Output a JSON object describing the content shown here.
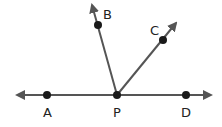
{
  "diagram": {
    "type": "geometry-rays",
    "line_color": "#555555",
    "point_color": "#1a1a1a",
    "points": {
      "A": {
        "label": "A",
        "x": 47,
        "y": 95
      },
      "P": {
        "label": "P",
        "x": 117,
        "y": 95
      },
      "D": {
        "label": "D",
        "x": 186,
        "y": 95
      },
      "B": {
        "label": "B",
        "x": 98,
        "y": 25
      },
      "C": {
        "label": "C",
        "x": 163,
        "y": 40
      }
    }
  }
}
